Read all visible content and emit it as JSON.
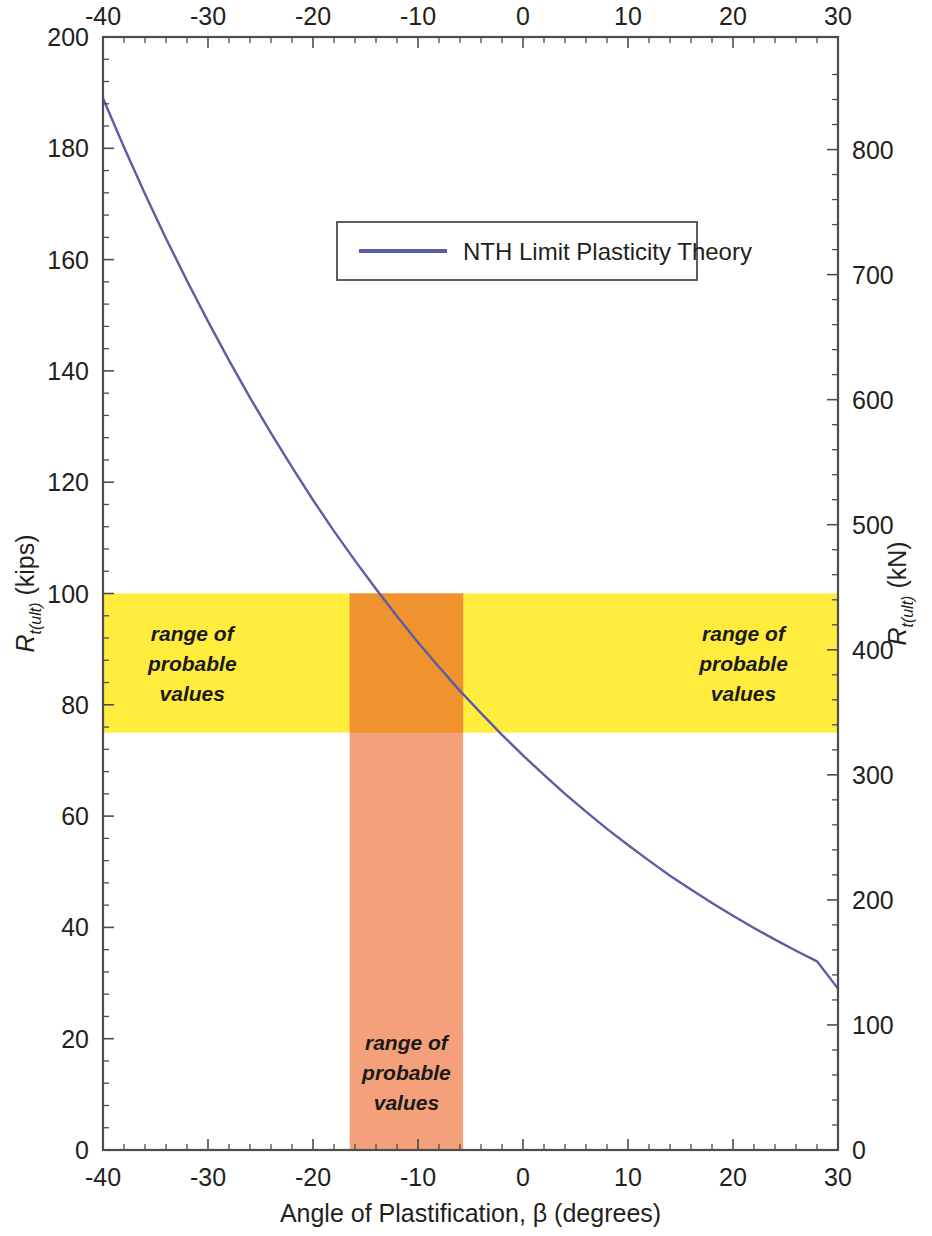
{
  "chart_data": {
    "type": "line",
    "title": "",
    "xlabel": "Angle of Plastification, β (degrees)",
    "ylabel_left_main": "R",
    "ylabel_left_sub": "t(ult)",
    "ylabel_left_unit": " (kips)",
    "ylabel_right_main": "R",
    "ylabel_right_sub": "t(ult)",
    "ylabel_right_unit": " (kN)",
    "xlim": [
      -40,
      30
    ],
    "ylim_left": [
      0,
      200
    ],
    "ylim_right": [
      0,
      890
    ],
    "xticks": [
      -40,
      -30,
      -20,
      -10,
      0,
      10,
      20,
      30
    ],
    "xticklabels": [
      "-40",
      "-30",
      "-20",
      "-10",
      "0",
      "10",
      "20",
      "30"
    ],
    "yticks_left": [
      0,
      20,
      40,
      60,
      80,
      100,
      120,
      140,
      160,
      180,
      200
    ],
    "yticklabels_left": [
      "0",
      "20",
      "40",
      "60",
      "80",
      "100",
      "120",
      "140",
      "160",
      "180",
      "200"
    ],
    "yticks_right": [
      0,
      100,
      200,
      300,
      400,
      500,
      600,
      700,
      800
    ],
    "yticklabels_right": [
      "0",
      "100",
      "200",
      "300",
      "400",
      "500",
      "600",
      "700",
      "800"
    ],
    "grid": false,
    "top_axis_mirrored": true,
    "right_axis_secondary": true,
    "minor_ticks_per_interval": 5,
    "legend": {
      "position": "upper-center",
      "entries": [
        {
          "label": "NTH Limit Plasticity Theory",
          "color": "#5b5ea6",
          "style": "solid-line"
        }
      ]
    },
    "series": [
      {
        "name": "NTH Limit Plasticity Theory",
        "color": "#5b5ea6",
        "linewidth": 2.4,
        "x": [
          -40,
          -38,
          -36,
          -34,
          -32,
          -30,
          -28,
          -26,
          -24,
          -22,
          -20,
          -18,
          -16,
          -14,
          -12,
          -10,
          -8,
          -6,
          -4,
          -2,
          0,
          2,
          4,
          6,
          8,
          10,
          12,
          14,
          16,
          18,
          20,
          22,
          24,
          26,
          28,
          30
        ],
        "y": [
          189.0,
          180.2,
          171.8,
          163.8,
          156.2,
          148.9,
          141.9,
          135.2,
          128.8,
          122.7,
          116.8,
          111.2,
          105.9,
          100.8,
          95.9,
          91.2,
          86.8,
          82.5,
          78.5,
          74.6,
          70.9,
          67.4,
          64.0,
          60.8,
          57.7,
          54.8,
          52.0,
          49.3,
          46.8,
          44.4,
          42.1,
          39.9,
          37.8,
          35.8,
          33.9,
          29.0
        ]
      }
    ],
    "shaded_regions": [
      {
        "name": "horizontal-probable-range",
        "orientation": "horizontal",
        "color": "#ffec3d",
        "y_range": [
          75,
          100
        ],
        "x_range": [
          -40,
          30
        ],
        "labels": [
          {
            "text_lines": [
              "range of",
              "probable",
              "values"
            ],
            "x": -31.5,
            "y": 87.5
          },
          {
            "text_lines": [
              "range of",
              "probable",
              "values"
            ],
            "x": 21.0,
            "y": 87.5
          }
        ]
      },
      {
        "name": "vertical-probable-range",
        "orientation": "vertical",
        "color": "#f4a07a",
        "x_range": [
          -16.5,
          -5.7
        ],
        "y_range": [
          0,
          100
        ],
        "labels": [
          {
            "text_lines": [
              "range of",
              "probable",
              "values"
            ],
            "x": -11.1,
            "y": 14.0
          }
        ]
      }
    ],
    "intersections": [
      {
        "description": "curve crosses upper bound of probable range",
        "x": -16.2,
        "y": 100
      },
      {
        "description": "curve crosses lower bound of probable range",
        "x": -5.9,
        "y": 75
      }
    ],
    "colors": {
      "curve": "#5b5ea6",
      "yellow_band": "#ffec3d",
      "orange_band": "#f4a07a",
      "overlap_band": "#f0922e",
      "axis": "#4d4d4d",
      "text": "#231f20",
      "background": "#ffffff"
    }
  }
}
